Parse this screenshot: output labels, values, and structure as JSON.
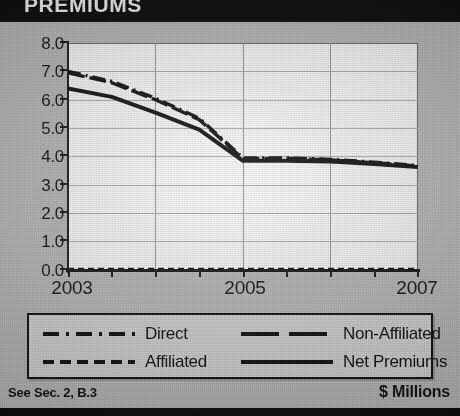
{
  "title": "PREMIUMS",
  "footer": {
    "source_note": "See Sec. 2, B.3",
    "units": "$ Millions"
  },
  "legend": {
    "items": [
      {
        "label": "Direct",
        "style": "dash-dot",
        "sample": "dash-dot-line-icon"
      },
      {
        "label": "Non-Affiliated",
        "style": "long-dash",
        "sample": "long-dash-line-icon"
      },
      {
        "label": "Affiliated",
        "style": "short-dash",
        "sample": "short-dash-line-icon"
      },
      {
        "label": "Net Premiums",
        "style": "solid",
        "sample": "solid-line-icon"
      }
    ]
  },
  "chart_data": {
    "type": "line",
    "title": "PREMIUMS",
    "xlabel": "",
    "ylabel": "$ Millions",
    "ylim": [
      0.0,
      8.0
    ],
    "ytick_step": 1.0,
    "ytick_labels": [
      "8.0",
      "7.0",
      "6.0",
      "5.0",
      "4.0",
      "3.0",
      "2.0",
      "1.0",
      "0.0"
    ],
    "xtick_labels": [
      "2003",
      "2005",
      "2007"
    ],
    "xlim": [
      2003,
      2007
    ],
    "x_minor_step": 0.5,
    "grid": true,
    "legend_position": "below",
    "x": [
      2003.0,
      2003.5,
      2004.0,
      2004.5,
      2005.0,
      2005.5,
      2006.0,
      2006.5,
      2007.0
    ],
    "series": [
      {
        "name": "Direct",
        "style": "dash-dot",
        "values": [
          7.0,
          6.65,
          6.05,
          5.35,
          3.95,
          3.95,
          3.9,
          3.8,
          3.68
        ]
      },
      {
        "name": "Non-Affiliated",
        "style": "long-dash",
        "values": [
          6.95,
          6.6,
          6.0,
          5.3,
          3.92,
          3.93,
          3.88,
          3.78,
          3.66
        ]
      },
      {
        "name": "Net Premiums",
        "style": "solid",
        "values": [
          6.4,
          6.1,
          5.55,
          4.95,
          3.85,
          3.85,
          3.82,
          3.74,
          3.63
        ]
      },
      {
        "name": "Affiliated",
        "style": "short-dash",
        "values": [
          0.02,
          0.02,
          0.02,
          0.02,
          0.02,
          0.02,
          0.02,
          0.02,
          0.02
        ]
      }
    ]
  },
  "colors": {
    "ink": "#151515",
    "plot_background": "#f7f7f7",
    "page_background": "#b8b8b8",
    "titlebar": "#0b0b0b",
    "grid": "#9a9a9a"
  }
}
